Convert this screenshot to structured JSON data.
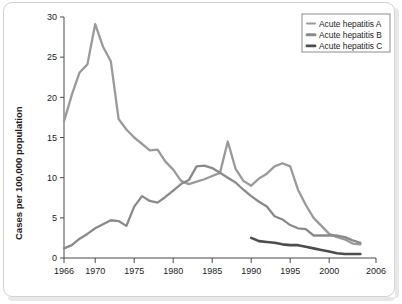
{
  "figure": {
    "background_color": "#ffffff",
    "border_color": "#d2d2d2"
  },
  "chart_data": {
    "type": "line",
    "title": "",
    "subtitle": "",
    "xlabel": "",
    "ylabel": "Cases per 100,000 population",
    "xlim": [
      1966,
      2006
    ],
    "ylim": [
      0,
      30
    ],
    "grid": false,
    "legend_position": "top-right",
    "x_ticks": [
      1966,
      1970,
      1975,
      1980,
      1985,
      1990,
      1995,
      2000,
      2006
    ],
    "x_tick_labels": [
      "1966",
      "1970",
      "1975",
      "1980",
      "1985",
      "1990",
      "1995",
      "2000",
      "2006"
    ],
    "y_ticks": [
      0,
      5,
      10,
      15,
      20,
      25,
      30
    ],
    "y_tick_labels": [
      "0",
      "5",
      "10",
      "15",
      "20",
      "25",
      "30"
    ],
    "series": [
      {
        "name": "Acute hepatitis A",
        "color": "#9a9a9a",
        "stroke_width": 2.3,
        "x": [
          1966,
          1967,
          1968,
          1969,
          1970,
          1971,
          1972,
          1973,
          1974,
          1975,
          1976,
          1977,
          1978,
          1979,
          1980,
          1981,
          1982,
          1983,
          1984,
          1985,
          1986,
          1987,
          1988,
          1989,
          1990,
          1991,
          1992,
          1993,
          1994,
          1995,
          1996,
          1997,
          1998,
          1999,
          2000,
          2001,
          2002,
          2003,
          2004
        ],
        "values": [
          17.0,
          20.3,
          23.1,
          24.1,
          29.1,
          26.3,
          24.5,
          17.3,
          16.0,
          15.0,
          14.2,
          13.4,
          13.5,
          12.0,
          11.0,
          9.6,
          9.2,
          9.5,
          9.8,
          10.2,
          10.6,
          14.5,
          11.1,
          9.6,
          9.0,
          9.9,
          10.5,
          11.4,
          11.8,
          11.4,
          8.5,
          6.6,
          5.0,
          4.0,
          3.0,
          2.6,
          2.3,
          1.8,
          1.7
        ]
      },
      {
        "name": "Acute hepatitis B",
        "color": "#8a8a8a",
        "stroke_width": 2.3,
        "x": [
          1966,
          1967,
          1968,
          1969,
          1970,
          1971,
          1972,
          1973,
          1974,
          1975,
          1976,
          1977,
          1978,
          1979,
          1980,
          1981,
          1982,
          1983,
          1984,
          1985,
          1986,
          1987,
          1988,
          1989,
          1990,
          1991,
          1992,
          1993,
          1994,
          1995,
          1996,
          1997,
          1998,
          1999,
          2000,
          2001,
          2002,
          2003,
          2004
        ],
        "values": [
          1.2,
          1.6,
          2.4,
          3.0,
          3.7,
          4.2,
          4.7,
          4.6,
          4.0,
          6.4,
          7.7,
          7.1,
          6.9,
          7.6,
          8.4,
          9.2,
          9.7,
          11.4,
          11.5,
          11.2,
          10.6,
          10.0,
          9.4,
          8.5,
          7.7,
          7.0,
          6.4,
          5.2,
          4.8,
          4.1,
          3.7,
          3.6,
          2.8,
          2.8,
          2.8,
          2.8,
          2.6,
          2.2,
          1.9
        ]
      },
      {
        "name": "Acute hepatitis C",
        "color": "#4d4d4d",
        "stroke_width": 2.6,
        "x": [
          1990,
          1991,
          1992,
          1993,
          1994,
          1995,
          1996,
          1997,
          1998,
          1999,
          2000,
          2001,
          2002,
          2003,
          2004
        ],
        "values": [
          2.5,
          2.1,
          2.0,
          1.9,
          1.7,
          1.6,
          1.6,
          1.4,
          1.2,
          1.0,
          0.8,
          0.6,
          0.5,
          0.5,
          0.5
        ]
      }
    ]
  },
  "legend": {
    "items": [
      {
        "label": "Acute hepatitis A",
        "color": "#9a9a9a",
        "marker": "line-swatch"
      },
      {
        "label": "Acute hepatitis B",
        "color": "#8a8a8a",
        "marker": "line-swatch"
      },
      {
        "label": "Acute hepatitis C",
        "color": "#4d4d4d",
        "marker": "line-swatch"
      }
    ]
  }
}
